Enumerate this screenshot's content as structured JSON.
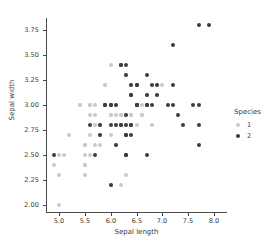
{
  "chart_data": {
    "type": "scatter",
    "title": "",
    "xlabel": "Sepal length",
    "ylabel": "Sepal width",
    "xlim": [
      4.75,
      8.25
    ],
    "ylim": [
      1.93,
      3.87
    ],
    "xticks": [
      "5.0",
      "5.5",
      "6.0",
      "6.5",
      "7.0",
      "7.5",
      "8.0"
    ],
    "xtick_values": [
      5.0,
      5.5,
      6.0,
      6.5,
      7.0,
      7.5,
      8.0
    ],
    "yticks": [
      "2.00",
      "2.25",
      "2.50",
      "2.75",
      "3.00",
      "3.25",
      "3.50",
      "3.75"
    ],
    "ytick_values": [
      2.0,
      2.25,
      2.5,
      2.75,
      3.0,
      3.25,
      3.5,
      3.75
    ],
    "grid": false,
    "legend": {
      "title": "Species",
      "position": "right",
      "entries": [
        {
          "label": "1",
          "color": "#c9c9c9",
          "series": "1"
        },
        {
          "label": "2",
          "color": "#3c3c3c",
          "series": "2"
        }
      ]
    },
    "series": [
      {
        "name": "1",
        "color": "#c9c9c9",
        "points": [
          [
            4.9,
            2.4
          ],
          [
            5.0,
            2.3
          ],
          [
            5.0,
            2.0
          ],
          [
            5.0,
            2.5
          ],
          [
            5.1,
            2.5
          ],
          [
            5.2,
            2.7
          ],
          [
            5.4,
            3.0
          ],
          [
            5.5,
            2.3
          ],
          [
            5.5,
            2.4
          ],
          [
            5.5,
            2.5
          ],
          [
            5.5,
            2.6
          ],
          [
            5.6,
            2.5
          ],
          [
            5.6,
            2.9
          ],
          [
            5.6,
            3.0
          ],
          [
            5.6,
            2.7
          ],
          [
            5.7,
            2.6
          ],
          [
            5.7,
            2.8
          ],
          [
            5.7,
            3.0
          ],
          [
            5.7,
            2.9
          ],
          [
            5.8,
            2.6
          ],
          [
            5.8,
            2.7
          ],
          [
            5.9,
            3.0
          ],
          [
            5.9,
            3.2
          ],
          [
            5.9,
            3.0
          ],
          [
            6.0,
            2.2
          ],
          [
            6.0,
            2.7
          ],
          [
            6.0,
            2.9
          ],
          [
            6.0,
            3.0
          ],
          [
            6.0,
            3.4
          ],
          [
            6.1,
            2.8
          ],
          [
            6.1,
            2.9
          ],
          [
            6.1,
            3.0
          ],
          [
            6.1,
            2.6
          ],
          [
            6.2,
            2.2
          ],
          [
            6.2,
            2.9
          ],
          [
            6.3,
            2.3
          ],
          [
            6.3,
            2.5
          ],
          [
            6.3,
            3.3
          ],
          [
            6.4,
            2.9
          ],
          [
            6.4,
            3.2
          ],
          [
            6.5,
            2.8
          ],
          [
            6.6,
            2.9
          ],
          [
            6.6,
            3.0
          ],
          [
            6.7,
            3.0
          ],
          [
            6.7,
            3.1
          ],
          [
            6.8,
            2.8
          ],
          [
            6.9,
            3.1
          ],
          [
            6.9,
            3.2
          ],
          [
            7.0,
            3.2
          ],
          [
            5.5,
            2.4
          ],
          [
            5.8,
            2.8
          ],
          [
            6.3,
            2.8
          ],
          [
            6.1,
            3.0
          ],
          [
            5.9,
            3.0
          ],
          [
            6.7,
            3.1
          ],
          [
            5.5,
            2.6
          ],
          [
            6.0,
            2.9
          ],
          [
            5.6,
            3.0
          ],
          [
            6.2,
            2.9
          ],
          [
            6.4,
            2.9
          ],
          [
            5.7,
            2.8
          ],
          [
            6.3,
            2.7
          ],
          [
            6.5,
            3.0
          ],
          [
            5.4,
            3.0
          ],
          [
            5.8,
            2.7
          ],
          [
            6.0,
            3.0
          ],
          [
            6.6,
            2.9
          ],
          [
            6.2,
            2.8
          ],
          [
            6.3,
            2.9
          ],
          [
            5.9,
            3.2
          ]
        ]
      },
      {
        "name": "2",
        "color": "#3c3c3c",
        "points": [
          [
            4.9,
            2.5
          ],
          [
            5.6,
            2.8
          ],
          [
            5.7,
            2.5
          ],
          [
            5.8,
            2.7
          ],
          [
            5.8,
            2.8
          ],
          [
            5.9,
            3.0
          ],
          [
            6.0,
            2.2
          ],
          [
            6.0,
            3.0
          ],
          [
            6.0,
            2.8
          ],
          [
            6.1,
            3.0
          ],
          [
            6.1,
            2.6
          ],
          [
            6.2,
            2.8
          ],
          [
            6.2,
            3.4
          ],
          [
            6.2,
            3.4
          ],
          [
            6.3,
            2.5
          ],
          [
            6.3,
            2.7
          ],
          [
            6.3,
            2.8
          ],
          [
            6.3,
            2.9
          ],
          [
            6.3,
            3.3
          ],
          [
            6.3,
            3.4
          ],
          [
            6.4,
            2.7
          ],
          [
            6.4,
            2.8
          ],
          [
            6.4,
            3.1
          ],
          [
            6.4,
            3.2
          ],
          [
            6.5,
            3.0
          ],
          [
            6.5,
            3.0
          ],
          [
            6.5,
            3.2
          ],
          [
            6.7,
            2.5
          ],
          [
            6.7,
            3.0
          ],
          [
            6.7,
            3.1
          ],
          [
            6.7,
            3.3
          ],
          [
            6.8,
            3.0
          ],
          [
            6.8,
            3.2
          ],
          [
            6.9,
            3.1
          ],
          [
            6.9,
            3.2
          ],
          [
            7.1,
            3.0
          ],
          [
            7.2,
            3.0
          ],
          [
            7.2,
            3.2
          ],
          [
            7.2,
            3.6
          ],
          [
            7.3,
            2.9
          ],
          [
            7.4,
            2.8
          ],
          [
            7.6,
            3.0
          ],
          [
            7.7,
            2.6
          ],
          [
            7.7,
            2.8
          ],
          [
            7.7,
            3.0
          ],
          [
            7.7,
            3.8
          ],
          [
            7.9,
            3.8
          ],
          [
            6.5,
            3.2
          ],
          [
            6.3,
            2.5
          ],
          [
            5.9,
            3.0
          ],
          [
            6.1,
            2.8
          ],
          [
            6.4,
            2.8
          ],
          [
            6.0,
            3.0
          ],
          [
            6.2,
            2.8
          ],
          [
            6.3,
            2.7
          ],
          [
            6.7,
            3.0
          ],
          [
            6.5,
            3.0
          ],
          [
            6.4,
            3.1
          ]
        ]
      }
    ]
  }
}
